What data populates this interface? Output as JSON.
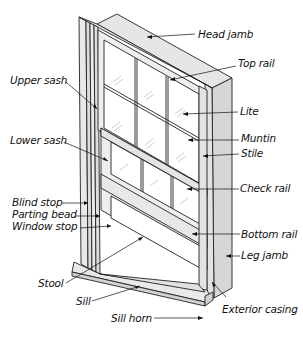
{
  "diagram": {
    "colors": {
      "stroke": "#222222",
      "frame_face": "#e9e9e9",
      "frame_side": "#d4d4d4",
      "glass": "#ffffff",
      "glare": "#b8b8b8"
    },
    "labels": {
      "head_jamb": "Head jamb",
      "top_rail": "Top rail",
      "upper_sash": "Upper sash",
      "lite": "Lite",
      "muntin": "Muntin",
      "stile": "Stile",
      "lower_sash": "Lower sash",
      "check_rail": "Check rail",
      "blind_stop": "Blind stop",
      "parting_bead": "Parting bead",
      "window_stop": "Window stop",
      "bottom_rail": "Bottom rail",
      "leg_jamb": "Leg jamb",
      "stool": "Stool",
      "sill": "Sill",
      "exterior_casing": "Exterior casing",
      "sill_horn": "Sill horn"
    }
  }
}
